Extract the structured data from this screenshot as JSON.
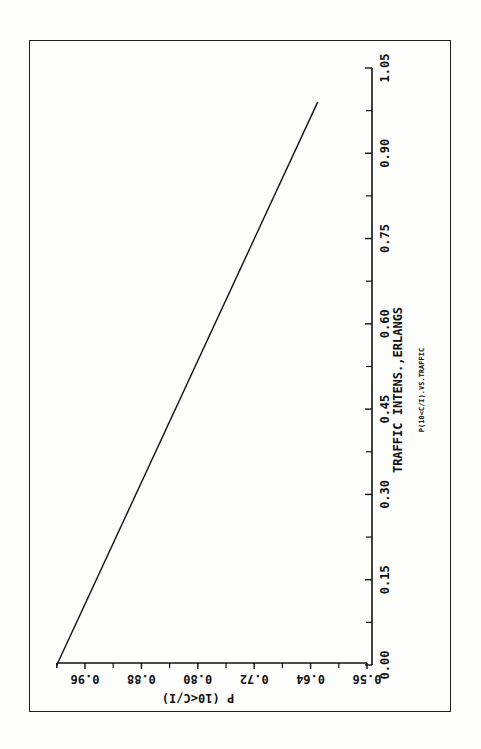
{
  "chart_data": {
    "type": "line",
    "orientation": "rotated-90-clockwise",
    "title": "",
    "caption": "P(10<C/I).VS.TRAFFIC",
    "xlabel": "TRAFFIC INTENS.,ERLANGS",
    "ylabel": "P (10<C/I)",
    "x_ticks": [
      "0.00",
      "0.15",
      "0.30",
      "0.45",
      "0.60",
      "0.75",
      "0.90",
      "1.05"
    ],
    "y_ticks": [
      "0.56",
      "0.64",
      "0.72",
      "0.80",
      "0.88",
      "0.96"
    ],
    "xlim": [
      0.0,
      1.05
    ],
    "ylim": [
      0.56,
      1.0
    ],
    "grid": false,
    "legend": null,
    "series": [
      {
        "name": "P(10<C/I)",
        "x": [
          0.0,
          0.99
        ],
        "y": [
          1.0,
          0.63
        ]
      }
    ]
  }
}
